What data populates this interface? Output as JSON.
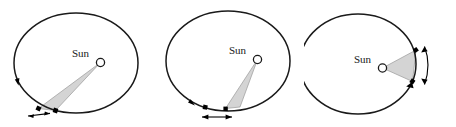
{
  "figure": {
    "background_color": "#ffffff",
    "orbit_stroke_color": "#1a1a1a",
    "wedge_fill_color": "#d4d4d4",
    "wedge_stroke_color": "#8c8c8c",
    "marker_color": "#000000",
    "panel_count": 3
  },
  "panels": [
    {
      "id": "panel-1",
      "position": "left",
      "sun_label": "Sun",
      "sun_marker": "open-circle",
      "orbit_shape": "ellipse",
      "wedge_description": "long narrow wedge from Sun to far lower-left orbit arc",
      "arc_indicator": "double-headed straight arrow below lower-left arc",
      "arc_endpoint_markers": 2,
      "orbit_direction_arrow": "counterclockwise arrowhead on left side of orbit",
      "swept_region": "aphelion",
      "arc_length": "short"
    },
    {
      "id": "panel-2",
      "position": "center",
      "sun_label": "Sun",
      "sun_marker": "open-circle",
      "orbit_shape": "ellipse",
      "wedge_description": "narrow wedge from Sun down to bottom orbit arc",
      "arc_indicator": "double-headed straight arrow below bottom arc",
      "arc_endpoint_markers": 2,
      "orbit_direction_arrow": "arrowhead on lower-left orbit",
      "swept_region": "intermediate",
      "arc_length": "medium"
    },
    {
      "id": "panel-3",
      "position": "right",
      "sun_label": "Sun",
      "sun_marker": "open-circle",
      "orbit_shape": "ellipse",
      "wedge_description": "short wide wedge from Sun to near right orbit arc",
      "arc_indicator": "curved double-headed arrow outside right arc",
      "arc_endpoint_markers": 2,
      "orbit_direction_arrow": "arrowhead on lower-right orbit",
      "swept_region": "perihelion",
      "arc_length": "long"
    }
  ]
}
